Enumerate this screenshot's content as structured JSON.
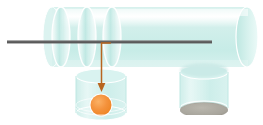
{
  "figure": {
    "type": "scientific-illustration",
    "canvas": {
      "width": 263,
      "height": 125,
      "background": "#ffffff"
    }
  },
  "palette": {
    "tube_fill": "#cdeeea",
    "tube_fill_light": "#d9f2ef",
    "tube_highlight": "#ffffff",
    "tube_edge": "#b8e4df",
    "disc_fill": "#bfe8e3",
    "disc_edge": "#ffffff",
    "rod_dark": "#5a5a5a",
    "rod_mid": "#6e6e6e",
    "arrow_orange": "#b8651f",
    "particle_fill": "#f4923c",
    "particle_edge": "#ffffff",
    "deposit_gray": "#a8a59c",
    "deposit_edge": "#8e8b82"
  },
  "elements": {
    "main_tube": {
      "name": "horizontal cylinder",
      "x": 52,
      "y": 7,
      "width": 206,
      "height": 60,
      "cap_rx": 11,
      "cap_ry": 30
    },
    "internal_discs": [
      {
        "label": "disc-1",
        "cx": 61,
        "cy": 37,
        "rx": 9,
        "ry": 30
      },
      {
        "label": "disc-2",
        "cx": 87,
        "cy": 37,
        "rx": 9,
        "ry": 30
      },
      {
        "label": "disc-3",
        "cx": 112,
        "cy": 37,
        "rx": 9,
        "ry": 30
      }
    ],
    "probe_rod": {
      "name": "horizontal probe rod",
      "x1": 7,
      "x2": 212,
      "y": 42,
      "thickness": 3
    },
    "drop_arrow": {
      "name": "particle trajectory arrow",
      "start_x": 110,
      "start_y": 43,
      "corner_x": 101,
      "corner_y": 43,
      "end_x": 101,
      "end_y": 91
    },
    "left_container": {
      "name": "collection vial left",
      "x": 76,
      "y": 72,
      "width": 50,
      "height": 48,
      "ellipse_ry": 7
    },
    "right_container": {
      "name": "collection vial right",
      "x": 180,
      "y": 67,
      "width": 48,
      "height": 48,
      "ellipse_ry": 7
    },
    "particle": {
      "name": "orange particle",
      "cx": 101,
      "cy": 105,
      "r": 11
    },
    "deposit": {
      "name": "gray deposit layer",
      "cx": 204,
      "cy": 110,
      "rx": 24,
      "ry": 7
    }
  }
}
